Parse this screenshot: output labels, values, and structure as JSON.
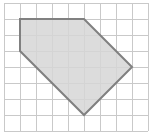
{
  "figure": {
    "type": "geometry-grid-figure",
    "canvas": {
      "width": 164,
      "height": 135
    },
    "grid": {
      "name": "square-grid",
      "origin_x": 4,
      "origin_y": 3,
      "cell_size": 16,
      "columns": 9,
      "rows": 8,
      "line_color": "#c9c9c9",
      "line_width": 1,
      "visible": true
    },
    "shape": {
      "name": "pentagon",
      "sides": 5,
      "fill_color": "#d6d6d6",
      "fill_opacity": 0.85,
      "stroke_color": "#808080",
      "stroke_width": 2,
      "vertices_grid": [
        {
          "label": "A",
          "col": 1,
          "row": 1
        },
        {
          "label": "B",
          "col": 5,
          "row": 1
        },
        {
          "label": "C",
          "col": 8,
          "row": 4
        },
        {
          "label": "D",
          "col": 5,
          "row": 7
        },
        {
          "label": "E",
          "col": 1,
          "row": 3
        }
      ],
      "vertices_px": [
        {
          "label": "A",
          "x": 20,
          "y": 19
        },
        {
          "label": "B",
          "x": 84,
          "y": 19
        },
        {
          "label": "C",
          "x": 132,
          "y": 67
        },
        {
          "label": "D",
          "x": 84,
          "y": 115
        },
        {
          "label": "E",
          "x": 20,
          "y": 51
        }
      ],
      "path_d": "M 20 19 L 84 19 L 132 67 L 84 115 L 20 51 Z"
    }
  }
}
